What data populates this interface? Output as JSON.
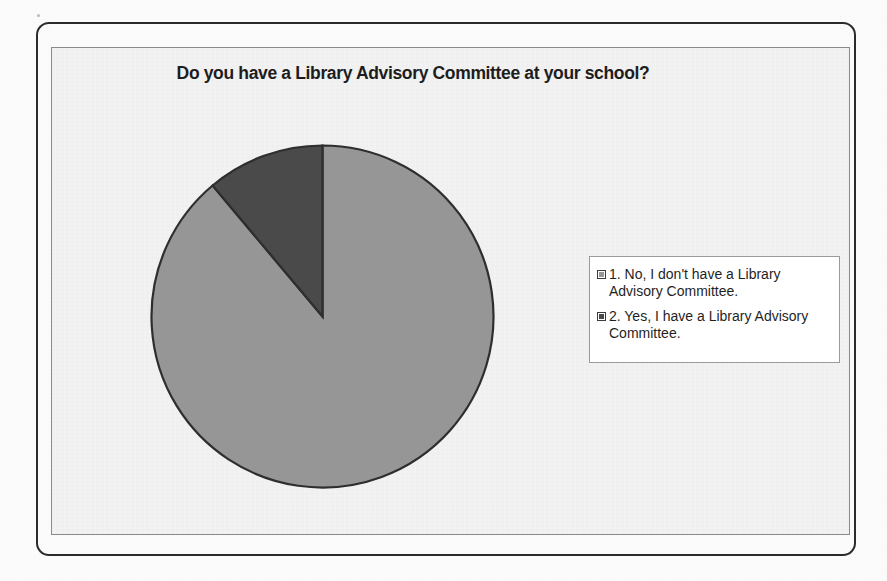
{
  "chart_data": {
    "type": "pie",
    "title": "Do you have a Library Advisory Committee at your school?",
    "xlabel": "",
    "ylabel": "",
    "legend_position": "right",
    "grid": false,
    "categories": [
      "1. No, I don't have a Library Advisory Committee.",
      "2. Yes, I have a Library Advisory Committee."
    ],
    "values": [
      89,
      11
    ],
    "slices": [
      {
        "label": "1. No, I don't have a Library Advisory Committee.",
        "value": 89,
        "color": "#969696",
        "start_angle_deg": 0,
        "end_angle_deg": 320
      },
      {
        "label": "2. Yes, I have a Library Advisory Committee.",
        "value": 11,
        "color": "#4a4a4a",
        "start_angle_deg": 320,
        "end_angle_deg": 360
      }
    ]
  },
  "chart": {
    "title": "Do you have a Library Advisory Committee at your school?",
    "plot_background": "#f4f4f4",
    "outline_color": "#2b2b2b"
  },
  "legend": {
    "items": [
      {
        "label": "1. No, I don't have a Library Advisory Committee.",
        "swatch_color": "#969696"
      },
      {
        "label": "2. Yes, I have a Library Advisory Committee.",
        "swatch_color": "#4a4a4a"
      }
    ]
  }
}
